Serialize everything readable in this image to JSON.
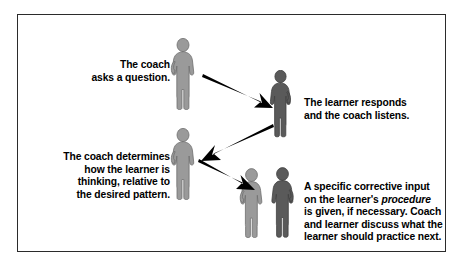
{
  "diagram": {
    "border_color": "#2b2b2b",
    "background_color": "#ffffff",
    "text_color": "#000000",
    "coach_figure_color": "#9a9a9a",
    "learner_figure_color": "#5a5a5a",
    "arrow_color": "#000000",
    "captions": [
      {
        "id": "coach-asks",
        "text": "The coach\nasks a question.",
        "align": "right"
      },
      {
        "id": "learner-responds",
        "text": "The learner responds\nand the coach listens.",
        "align": "left"
      },
      {
        "id": "coach-determines",
        "text": "The coach determines\nhow the learner is\nthinking, relative to\nthe desired pattern.",
        "align": "right"
      },
      {
        "id": "corrective-input",
        "lead": "A specific corrective input\non the learner's ",
        "emphasis": "procedure",
        "tail": "\nis given, if necessary. Coach\nand learner discuss what the\nlearner should practice next.",
        "align": "left"
      }
    ],
    "figures": [
      {
        "id": "coach-1",
        "role": "coach",
        "shade": "#9a9a9a"
      },
      {
        "id": "learner-1",
        "role": "learner",
        "shade": "#5a5a5a"
      },
      {
        "id": "coach-2",
        "role": "coach",
        "shade": "#9a9a9a"
      },
      {
        "id": "coach-3",
        "role": "coach",
        "shade": "#9a9a9a"
      },
      {
        "id": "learner-2",
        "role": "learner",
        "shade": "#5a5a5a"
      }
    ],
    "arrows": [
      {
        "id": "arrow-coach-to-learner",
        "from": "coach-1",
        "to": "learner-1",
        "direction": "down-right"
      },
      {
        "id": "arrow-learner-to-coach",
        "from": "learner-1",
        "to": "coach-2",
        "direction": "down-left"
      },
      {
        "id": "arrow-coach-to-pair",
        "from": "coach-2",
        "to": "coach-3",
        "direction": "down-right"
      }
    ]
  }
}
